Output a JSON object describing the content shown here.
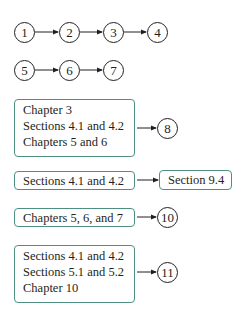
{
  "chains": [
    {
      "nodes": [
        "1",
        "2",
        "3",
        "4"
      ]
    },
    {
      "nodes": [
        "5",
        "6",
        "7"
      ]
    }
  ],
  "prerequisite_groups": [
    {
      "lines": [
        "Chapter 3",
        "Sections 4.1 and 4.2",
        "Chapters 5 and 6"
      ],
      "target": "8"
    },
    {
      "lines": [
        "Sections 4.1 and 4.2"
      ],
      "target": "Section 9.4"
    },
    {
      "lines": [
        "Chapters 5, 6, and 7"
      ],
      "target": "10"
    },
    {
      "lines": [
        "Sections 4.1 and 4.2",
        "Sections 5.1 and 5.2",
        "Chapter 10"
      ],
      "target": "11"
    }
  ],
  "colors": {
    "box_border": "#4f8f82",
    "ink": "#231f20"
  }
}
